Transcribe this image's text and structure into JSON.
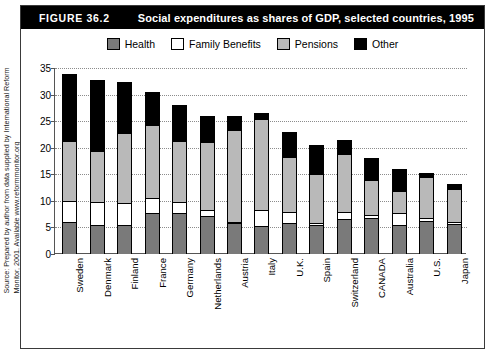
{
  "figure": {
    "number": "FIGURE 36.2",
    "title": "Social expenditures as shares of GDP, selected countries, 1995",
    "source": "Source: Prepared by author from data supplied by International Reform Monitor, 2001. Available www.reformmonitor.org"
  },
  "colors": {
    "health": "#7a7a7a",
    "family_benefits": "#ffffff",
    "pensions": "#b9b9b9",
    "other": "#000000",
    "title_bar": "#000000",
    "frame": "#3a3a3a"
  },
  "chart_data": {
    "type": "bar",
    "subtype": "stacked",
    "title": "Social expenditures as shares of GDP, selected countries, 1995",
    "xlabel": "",
    "ylabel": "",
    "ylim": [
      0,
      35
    ],
    "yticks": [
      0,
      5,
      10,
      15,
      20,
      25,
      30,
      35
    ],
    "grid": true,
    "legend_position": "top-center",
    "categories": [
      "Sweden",
      "Denmark",
      "Finland",
      "France",
      "Germany",
      "Netherlands",
      "Austria",
      "Italy",
      "U.K.",
      "Spain",
      "Switzerland",
      "CANADA",
      "Australia",
      "U.S.",
      "Japan"
    ],
    "series": [
      {
        "name": "Health",
        "color": "#7a7a7a",
        "values": [
          6.0,
          5.5,
          5.4,
          7.8,
          7.7,
          7.2,
          5.8,
          5.3,
          5.8,
          5.5,
          6.6,
          6.7,
          5.5,
          6.3,
          5.6
        ]
      },
      {
        "name": "Family Benefits",
        "color": "#ffffff",
        "values": [
          4.0,
          4.3,
          4.2,
          2.7,
          2.1,
          1.0,
          0.3,
          3.0,
          2.1,
          0.4,
          1.3,
          0.6,
          2.3,
          0.4,
          0.4
        ]
      },
      {
        "name": "Pensions",
        "color": "#b9b9b9",
        "values": [
          11.3,
          9.6,
          13.2,
          13.7,
          11.4,
          12.8,
          17.2,
          17.2,
          10.3,
          9.2,
          10.9,
          6.6,
          4.0,
          7.8,
          6.2
        ]
      },
      {
        "name": "Other",
        "color": "#000000",
        "values": [
          12.5,
          13.4,
          9.5,
          6.3,
          6.8,
          5.0,
          2.7,
          1.0,
          4.8,
          5.4,
          2.7,
          4.1,
          4.2,
          0.8,
          1.0
        ]
      }
    ],
    "totals": [
      33.8,
      32.8,
      32.3,
      30.5,
      28.0,
      26.0,
      26.0,
      26.5,
      23.0,
      20.5,
      21.5,
      18.0,
      16.0,
      15.3,
      13.2
    ]
  }
}
